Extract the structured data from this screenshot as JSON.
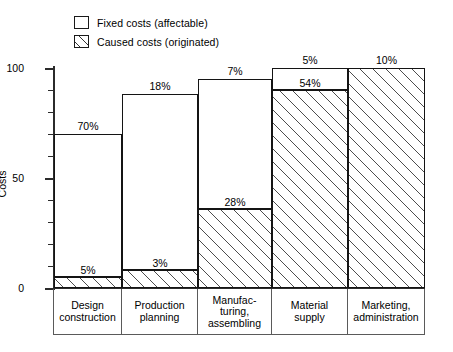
{
  "legend": {
    "items": [
      {
        "label": "Fixed costs (affectable)",
        "pattern": "solid",
        "icon": "square-outline-icon"
      },
      {
        "label": "Caused costs (originated)",
        "pattern": "hatched",
        "icon": "square-hatched-icon"
      }
    ]
  },
  "axis": {
    "y_title": "Costs",
    "y_ticks": [
      "0",
      "50",
      "100"
    ]
  },
  "chart_data": {
    "type": "bar",
    "title": "",
    "xlabel": "",
    "ylabel": "Costs",
    "ylim": [
      0,
      100
    ],
    "grid": false,
    "legend_position": "top-left",
    "categories": [
      "Design\nconstruction",
      "Production\nplanning",
      "Manufac-\nturing,\nassembling",
      "Material\nsupply",
      "Marketing,\nadministration"
    ],
    "category_lines": [
      [
        "Design",
        "construction"
      ],
      [
        "Production",
        "planning"
      ],
      [
        "Manufac-",
        "turing,",
        "assembling"
      ],
      [
        "Material",
        "supply"
      ],
      [
        "Marketing,",
        "administration"
      ]
    ],
    "series": [
      {
        "name": "Caused costs (originated)",
        "pattern": "hatched",
        "values": [
          5,
          8,
          36,
          90,
          100
        ],
        "segment_labels": [
          "5%",
          "3%",
          "28%",
          "54%",
          "10%"
        ],
        "segment_values": [
          5,
          3,
          28,
          54,
          10
        ]
      },
      {
        "name": "Fixed costs (affectable)",
        "pattern": "solid",
        "values": [
          70,
          88,
          95,
          100,
          100
        ],
        "segment_labels": [
          "70%",
          "18%",
          "7%",
          "5%",
          ""
        ],
        "segment_values": [
          70,
          18,
          7,
          5,
          0
        ]
      }
    ],
    "bar_tops": [
      70,
      88,
      95,
      100,
      100
    ],
    "hatch_tops": [
      5,
      8,
      36,
      90,
      100
    ],
    "top_labels": [
      "70%",
      "18%",
      "7%",
      "5%",
      "10%"
    ],
    "inner_labels": [
      "5%",
      "3%",
      "28%",
      "54%",
      ""
    ]
  }
}
